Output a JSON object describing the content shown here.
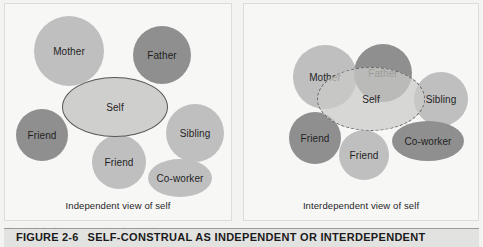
{
  "figure": {
    "number_label": "FIGURE 2-6",
    "title": "SELF-CONSTRUAL AS INDEPENDENT OR INTERDEPENDENT",
    "panels": [
      {
        "id": "independent",
        "caption": "Independent view of self",
        "self": {
          "label": "Self",
          "outline": "solid",
          "overlaps": false
        },
        "nodes": [
          {
            "label": "Mother",
            "shade": "light"
          },
          {
            "label": "Father",
            "shade": "dark"
          },
          {
            "label": "Friend",
            "shade": "dark"
          },
          {
            "label": "Sibling",
            "shade": "light"
          },
          {
            "label": "Friend",
            "shade": "light"
          },
          {
            "label": "Co-worker",
            "shade": "light"
          }
        ]
      },
      {
        "id": "interdependent",
        "caption": "Interdependent view of self",
        "self": {
          "label": "Self",
          "outline": "dashed",
          "overlaps": true
        },
        "nodes": [
          {
            "label": "Mother",
            "shade": "light"
          },
          {
            "label": "Father",
            "shade": "dark"
          },
          {
            "label": "Friend",
            "shade": "dark"
          },
          {
            "label": "Sibling",
            "shade": "light"
          },
          {
            "label": "Friend",
            "shade": "light"
          },
          {
            "label": "Co-worker",
            "shade": "dark"
          }
        ]
      }
    ]
  },
  "colors": {
    "page_background": "#f3f3f1",
    "panel_background": "#f7f7f6",
    "node_light": "#bfbfbf",
    "node_dark": "#8f8f8f",
    "self_fill": "#cfcfcd",
    "self_outline": "#585858",
    "caption_bar": "#e2e2e0",
    "text": "#1f1f1f"
  },
  "background_showthrough": "people in these cultures may not be as\nwhen made salient, so motivation differs\nsort with the goals of others. Cohen &\n\nwho view themselves as independent\nseparate from others, defined by their\nown internal attributes. In contrast,\nthose with an interdependent view see\nthemselves as fundamentally connected\nto the people around them, and their\nself-concept includes close others.\n\nThe way a person thinks about the\nself may also depend on the culture\nin which they were raised and live.\nThis distinction helps explain why\nsome cultures value the group and\nothers put the individual first."
}
